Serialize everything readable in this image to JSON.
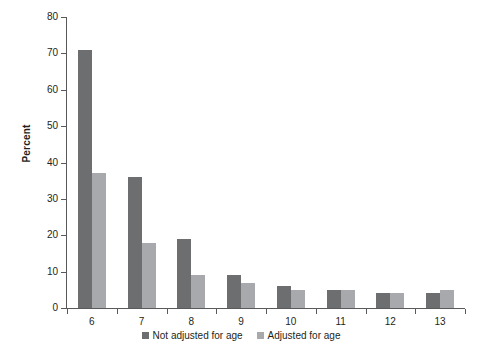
{
  "chart_data": {
    "type": "bar",
    "title": "",
    "xlabel": "",
    "ylabel": "Percent",
    "categories": [
      "6",
      "7",
      "8",
      "9",
      "10",
      "11",
      "12",
      "13"
    ],
    "series": [
      {
        "name": "Not adjusted for age",
        "color": "#6d6e70",
        "values": [
          71,
          36,
          19,
          9,
          6,
          5,
          4,
          4
        ]
      },
      {
        "name": "Adjusted for age",
        "color": "#a7a9ac",
        "values": [
          37,
          18,
          9,
          7,
          5,
          5,
          4,
          5
        ]
      }
    ],
    "ylim": [
      0,
      80
    ],
    "yticks": [
      0,
      10,
      20,
      30,
      40,
      50,
      60,
      70,
      80
    ],
    "ytick_labels": [
      "0",
      "10",
      "20",
      "30",
      "40",
      "50",
      "60",
      "70",
      "80"
    ],
    "grid": false,
    "legend_position": "bottom"
  },
  "axes": {
    "y_title": "Percent"
  },
  "legend": {
    "items": [
      {
        "label": "Not adjusted for age",
        "color": "#6d6e70"
      },
      {
        "label": "Adjusted for age",
        "color": "#a7a9ac"
      }
    ]
  },
  "colors": {
    "series_dark": "#6d6e70",
    "series_light": "#a7a9ac",
    "axis": "#58595b",
    "text": "#231f20",
    "background": "#ffffff"
  }
}
